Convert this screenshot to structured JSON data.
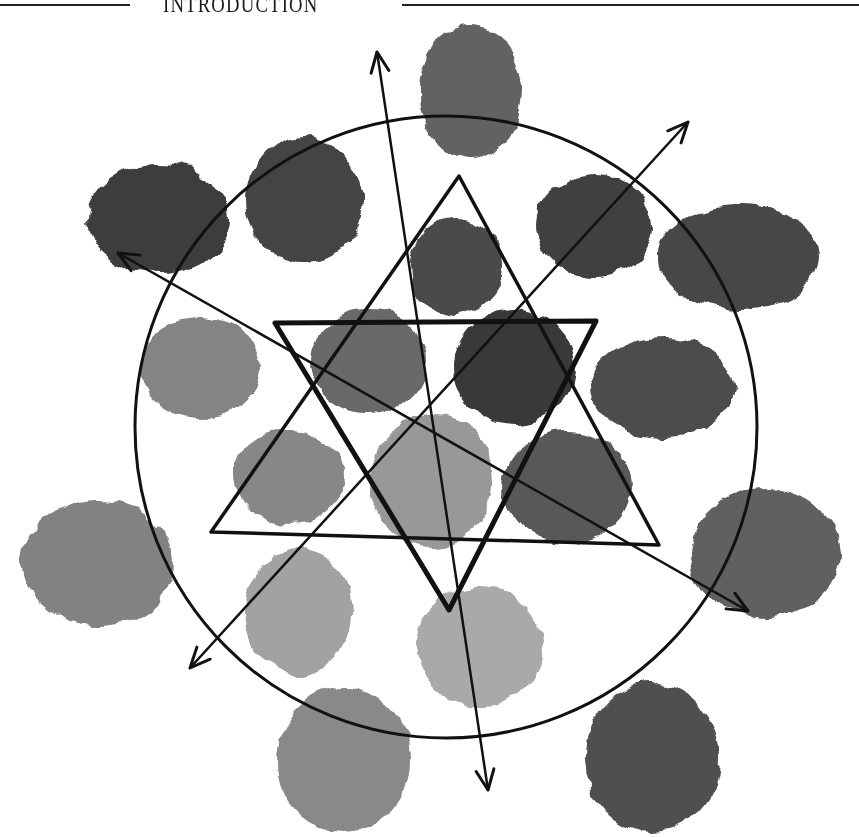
{
  "header": {
    "title": "INTRODUCTION"
  },
  "diagram": {
    "circle": {
      "cx": 446,
      "cy": 427,
      "r": 311
    },
    "triangle_up": {
      "points": "459,176 211,532 659,545"
    },
    "triangle_down": {
      "points": "275,323 596,321 449,610"
    },
    "arrows": [
      {
        "name": "vertical-arrow",
        "x1": 377,
        "y1": 52,
        "x2": 488,
        "y2": 790
      },
      {
        "name": "diagonal-up-right-arrow",
        "x1": 688,
        "y1": 122,
        "x2": 190,
        "y2": 668
      },
      {
        "name": "diagonal-down-right-arrow",
        "x1": 118,
        "y1": 253,
        "x2": 748,
        "y2": 611
      }
    ],
    "swatches": [
      {
        "name": "swatch-top",
        "cx": 470,
        "cy": 92,
        "rx": 52,
        "ry": 66,
        "color": "#555555"
      },
      {
        "name": "swatch-top-left-outer",
        "cx": 158,
        "cy": 219,
        "rx": 72,
        "ry": 55,
        "color": "#2e2e2e"
      },
      {
        "name": "swatch-top-left-inner",
        "cx": 305,
        "cy": 200,
        "rx": 58,
        "ry": 63,
        "color": "#353535"
      },
      {
        "name": "swatch-top-center",
        "cx": 456,
        "cy": 266,
        "rx": 47,
        "ry": 48,
        "color": "#3a3a3a"
      },
      {
        "name": "swatch-top-right-inner",
        "cx": 594,
        "cy": 225,
        "rx": 59,
        "ry": 52,
        "color": "#2f2f2f"
      },
      {
        "name": "swatch-top-right-outer",
        "cx": 740,
        "cy": 257,
        "rx": 82,
        "ry": 52,
        "color": "#383838"
      },
      {
        "name": "swatch-left",
        "cx": 200,
        "cy": 369,
        "rx": 60,
        "ry": 51,
        "color": "#7a7a7a"
      },
      {
        "name": "swatch-center-left",
        "cx": 368,
        "cy": 362,
        "rx": 58,
        "ry": 53,
        "color": "#5c5c5c"
      },
      {
        "name": "swatch-center-right",
        "cx": 514,
        "cy": 367,
        "rx": 61,
        "ry": 57,
        "color": "#282828"
      },
      {
        "name": "swatch-right",
        "cx": 663,
        "cy": 388,
        "rx": 73,
        "ry": 50,
        "color": "#3d3d3d"
      },
      {
        "name": "swatch-lower-left",
        "cx": 290,
        "cy": 477,
        "rx": 56,
        "ry": 46,
        "color": "#7d7d7d"
      },
      {
        "name": "swatch-lower-center",
        "cx": 432,
        "cy": 482,
        "rx": 62,
        "ry": 66,
        "color": "#8f8f8f"
      },
      {
        "name": "swatch-lower-right",
        "cx": 568,
        "cy": 487,
        "rx": 64,
        "ry": 56,
        "color": "#4a4a4a"
      },
      {
        "name": "swatch-far-left",
        "cx": 98,
        "cy": 563,
        "rx": 76,
        "ry": 62,
        "color": "#777777"
      },
      {
        "name": "swatch-far-right",
        "cx": 766,
        "cy": 554,
        "rx": 75,
        "ry": 65,
        "color": "#525252"
      },
      {
        "name": "swatch-bottom-left-inner",
        "cx": 298,
        "cy": 612,
        "rx": 54,
        "ry": 62,
        "color": "#9a9a9a"
      },
      {
        "name": "swatch-bottom-center",
        "cx": 480,
        "cy": 646,
        "rx": 63,
        "ry": 60,
        "color": "#a2a2a2"
      },
      {
        "name": "swatch-bottom-left-outer",
        "cx": 344,
        "cy": 760,
        "rx": 67,
        "ry": 72,
        "color": "#7f7f7f"
      },
      {
        "name": "swatch-bottom-right",
        "cx": 652,
        "cy": 758,
        "rx": 68,
        "ry": 74,
        "color": "#3f3f3f"
      }
    ],
    "colors": {
      "line": "#111111",
      "background": "#ffffff"
    }
  }
}
